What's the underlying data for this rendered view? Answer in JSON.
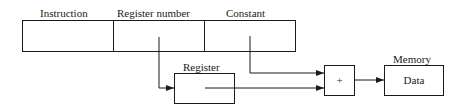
{
  "diagram": {
    "instruction_fields": [
      {
        "label": "Instruction"
      },
      {
        "label": "Register number"
      },
      {
        "label": "Constant"
      }
    ],
    "register": {
      "label": "Register"
    },
    "adder": {
      "symbol": "+"
    },
    "memory": {
      "label": "Memory",
      "content": "Data"
    }
  }
}
